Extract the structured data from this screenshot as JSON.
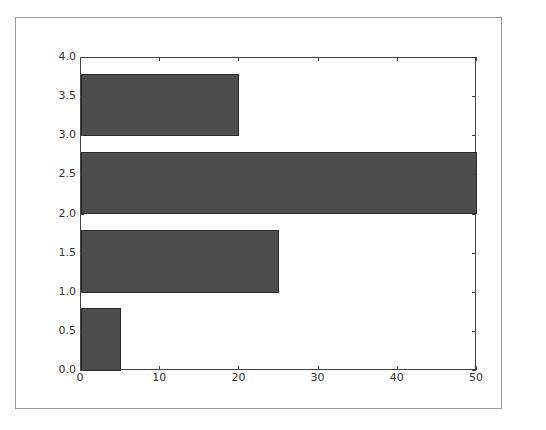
{
  "chart_data": {
    "type": "bar",
    "orientation": "horizontal",
    "title": "",
    "xlabel": "",
    "ylabel": "",
    "xlim": [
      0,
      50
    ],
    "ylim": [
      0,
      4.0
    ],
    "grid": false,
    "bar_height": 0.8,
    "bar_color": "#4d4d4d",
    "bars": [
      {
        "y": 0,
        "width": 5
      },
      {
        "y": 1,
        "width": 25
      },
      {
        "y": 2,
        "width": 50
      },
      {
        "y": 3,
        "width": 20
      }
    ],
    "xticks": [
      "0",
      "10",
      "20",
      "30",
      "40",
      "50"
    ],
    "yticks": [
      "0.0",
      "0.5",
      "1.0",
      "1.5",
      "2.0",
      "2.5",
      "3.0",
      "3.5",
      "4.0"
    ]
  }
}
